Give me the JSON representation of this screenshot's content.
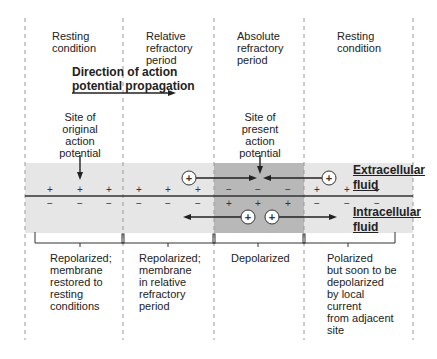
{
  "regions": [
    {
      "title": "Resting condition",
      "lines": [
        "Resting",
        "condition"
      ],
      "status_lines": [
        "Repolarized;",
        "membrane",
        "restored to",
        "resting",
        "conditions"
      ]
    },
    {
      "title": "Relative refractory period",
      "lines": [
        "Relative",
        "refractory",
        "period"
      ],
      "status_lines": [
        "Repolarized;",
        "membrane",
        "in relative",
        "refractory",
        "period"
      ]
    },
    {
      "title": "Absolute refractory period",
      "lines": [
        "Absolute",
        "refractory",
        "period"
      ],
      "status_lines": [
        "Depolarized"
      ]
    },
    {
      "title": "Resting condition",
      "lines": [
        "Resting",
        "condition"
      ],
      "status_lines": [
        "Polarized",
        "but soon to be",
        "depolarized",
        "by local",
        "current",
        "from adjacent",
        "site"
      ]
    }
  ],
  "direction_label": {
    "line1": "Direction of action",
    "line2": "potential propagation"
  },
  "site_original": {
    "lines": [
      "Site of",
      "original",
      "action",
      "potential"
    ]
  },
  "site_present": {
    "lines": [
      "Site of",
      "present",
      "action",
      "potential"
    ]
  },
  "extracellular": {
    "line1": "Extracellular",
    "line2": "fluid"
  },
  "intracellular": {
    "line1": "Intracellular",
    "line2": "fluid"
  },
  "charges": {
    "plus": "+",
    "minus": "−"
  },
  "colors": {
    "light_band": "#e6e6e6",
    "dark_band": "#b8b8b8",
    "membrane": "#333333",
    "dash": "#9a9a9a"
  }
}
